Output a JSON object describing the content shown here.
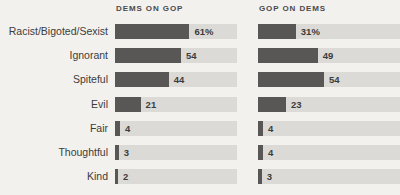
{
  "chart_data": {
    "type": "bar",
    "title": "",
    "subtitle": "",
    "xlabel": "",
    "ylabel": "",
    "orientation": "horizontal",
    "grid": false,
    "legend_position": "top",
    "xlim": [
      0,
      100
    ],
    "categories": [
      "Racist/Bigoted/Sexist",
      "Ignorant",
      "Spiteful",
      "Evil",
      "Fair",
      "Thoughtful",
      "Kind"
    ],
    "series": [
      {
        "name": "DEMS ON GOP",
        "values": [
          61,
          54,
          44,
          21,
          4,
          3,
          2
        ],
        "labels": [
          "61%",
          "54",
          "44",
          "21",
          "4",
          "3",
          "2"
        ]
      },
      {
        "name": "GOP ON DEMS",
        "values": [
          31,
          49,
          54,
          23,
          4,
          4,
          3
        ],
        "labels": [
          "31%",
          "49",
          "54",
          "23",
          "4",
          "4",
          "3"
        ]
      }
    ],
    "colors": {
      "bar": "#585755",
      "track": "#dcdad6",
      "background": "#f2f1ee",
      "text": "#3c3c3c"
    }
  },
  "headers": {
    "col1": "DEMS ON GOP",
    "col2": "GOP ON DEMS"
  },
  "rows": [
    {
      "label": "Racist/Bigoted/Sexist",
      "col1_value": "61%",
      "col1_pct": 61,
      "col2_value": "31%",
      "col2_pct": 31
    },
    {
      "label": "Ignorant",
      "col1_value": "54",
      "col1_pct": 54,
      "col2_value": "49",
      "col2_pct": 49
    },
    {
      "label": "Spiteful",
      "col1_value": "44",
      "col1_pct": 44,
      "col2_value": "54",
      "col2_pct": 54
    },
    {
      "label": "Evil",
      "col1_value": "21",
      "col1_pct": 21,
      "col2_value": "23",
      "col2_pct": 23
    },
    {
      "label": "Fair",
      "col1_value": "4",
      "col1_pct": 4,
      "col2_value": "4",
      "col2_pct": 4
    },
    {
      "label": "Thoughtful",
      "col1_value": "3",
      "col1_pct": 3,
      "col2_value": "4",
      "col2_pct": 4
    },
    {
      "label": "Kind",
      "col1_value": "2",
      "col1_pct": 2,
      "col2_value": "3",
      "col2_pct": 3
    }
  ]
}
